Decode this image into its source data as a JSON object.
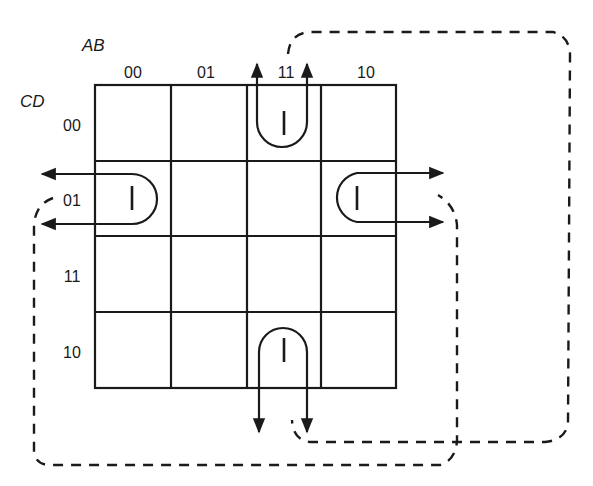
{
  "kmap": {
    "row_variable": "CD",
    "col_variable": "AB",
    "col_labels": [
      "00",
      "01",
      "11",
      "10"
    ],
    "row_labels": [
      "00",
      "01",
      "11",
      "10"
    ],
    "cells": [
      [
        "",
        "",
        "1",
        ""
      ],
      [
        "1",
        "",
        "",
        "1"
      ],
      [
        "",
        "",
        "",
        ""
      ],
      [
        "",
        "",
        "1",
        ""
      ]
    ],
    "one_glyph": "l"
  },
  "groups": [
    {
      "name": "wraparound-corner-group",
      "cells": [
        "AB=11,CD=00",
        "AB=11,CD=10",
        "AB=00,CD=01",
        "AB=10,CD=01"
      ]
    }
  ],
  "colors": {
    "line": "#1a1a1a",
    "background": "#ffffff"
  }
}
